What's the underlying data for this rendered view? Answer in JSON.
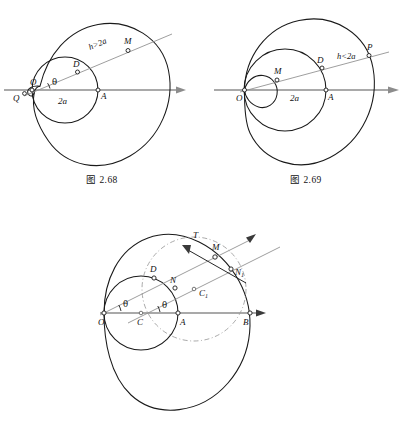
{
  "page": {
    "kind": "geometry-figure-sheet",
    "background_color": "#ffffff",
    "ink_color": "#1a1a1a",
    "axis_color": "#8c8c8c",
    "dashed_color": "#9a9a9a"
  },
  "figures": [
    {
      "id": "fig-2-68",
      "caption": "图 2.68",
      "curve_type": "limacon-with-inner-loop",
      "condition_label": "h>2a",
      "diameter_label": "2a",
      "angle_label": "θ",
      "points": [
        {
          "name": "O",
          "label": "O"
        },
        {
          "name": "Q",
          "label": "Q"
        },
        {
          "name": "D",
          "label": "D"
        },
        {
          "name": "M",
          "label": "M"
        },
        {
          "name": "A",
          "label": "A"
        }
      ]
    },
    {
      "id": "fig-2-69",
      "caption": "图 2.69",
      "curve_type": "limacon-without-inner-loop",
      "condition_label": "h<2a",
      "diameter_label": "2a",
      "points": [
        {
          "name": "O",
          "label": "O"
        },
        {
          "name": "M",
          "label": "M"
        },
        {
          "name": "D",
          "label": "D"
        },
        {
          "name": "P",
          "label": "P"
        },
        {
          "name": "A",
          "label": "A"
        }
      ]
    },
    {
      "id": "fig-2-70",
      "caption": "",
      "curve_type": "limacon-with-tangent-construction",
      "angle_label_1": "θ",
      "angle_label_2": "θ",
      "tangent_label": "T",
      "points": [
        {
          "name": "O",
          "label": "O"
        },
        {
          "name": "C",
          "label": "C"
        },
        {
          "name": "A",
          "label": "A"
        },
        {
          "name": "B",
          "label": "B"
        },
        {
          "name": "D",
          "label": "D"
        },
        {
          "name": "N",
          "label": "N"
        },
        {
          "name": "M",
          "label": "M"
        },
        {
          "name": "C1",
          "label": "C",
          "subscript": "1"
        },
        {
          "name": "N1",
          "label": "N",
          "subscript": "1"
        }
      ]
    }
  ]
}
